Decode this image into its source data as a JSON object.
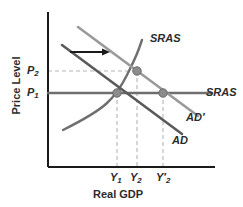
{
  "chart_data": {
    "type": "line",
    "title": "",
    "xlabel": "Real GDP",
    "ylabel": "Price Level",
    "grid": false,
    "legend": "none",
    "xlim": [
      0,
      1
    ],
    "ylim": [
      0,
      1
    ],
    "axis_ticks": {
      "x": [
        "Y1",
        "Y2",
        "Y2'"
      ],
      "y": [
        "P1",
        "P2"
      ]
    },
    "series": [
      {
        "name": "AD",
        "kind": "line",
        "color": "#5a5a5a",
        "points": [
          [
            62,
            45
          ],
          [
            182,
            134
          ]
        ],
        "label": "AD"
      },
      {
        "name": "AD'",
        "kind": "line",
        "color": "#9a9a9a",
        "points": [
          [
            78,
            27
          ],
          [
            198,
            116
          ]
        ],
        "label": "AD'"
      },
      {
        "name": "SRAS-upward",
        "kind": "curve",
        "color": "#6f6f6f",
        "points": [
          [
            63,
            130
          ],
          [
            95,
            114
          ],
          [
            118,
            93
          ],
          [
            136,
            57
          ],
          [
            142,
            40
          ]
        ],
        "label": "SRAS"
      },
      {
        "name": "SRAS-horizontal",
        "kind": "line",
        "color": "#6f6f6f",
        "points": [
          [
            48,
            93
          ],
          [
            212,
            93
          ]
        ],
        "label": "SRAS"
      }
    ],
    "markers": [
      {
        "name": "equilibrium-Y1-P1",
        "x": 117,
        "y": 93
      },
      {
        "name": "equilibrium-Y2-P2",
        "x": 137,
        "y": 71
      },
      {
        "name": "equilibrium-Y2prime-P1",
        "x": 163,
        "y": 93
      }
    ],
    "guides": [
      {
        "name": "p2-horizontal-dashed",
        "from": [
          48,
          71
        ],
        "to": [
          137,
          71
        ]
      },
      {
        "name": "y1-vertical-dashed",
        "from": [
          117,
          93
        ],
        "to": [
          117,
          167
        ]
      },
      {
        "name": "y2-vertical-dashed",
        "from": [
          137,
          71
        ],
        "to": [
          137,
          167
        ]
      },
      {
        "name": "y2prime-vertical-dashed",
        "from": [
          163,
          93
        ],
        "to": [
          163,
          167
        ]
      }
    ],
    "annotations": [
      {
        "name": "shift-arrow",
        "kind": "arrow",
        "from": [
          70,
          52
        ],
        "to": [
          110,
          52
        ],
        "color": "#1a1a1a",
        "text": ""
      }
    ]
  },
  "axes": {
    "y_title": "Price Level",
    "x_title": "Real GDP"
  },
  "ticks": {
    "price_high_base": "P",
    "price_high_sub": "2",
    "price_low_base": "P",
    "price_low_sub": "1",
    "y1_base": "Y",
    "y1_sub": "1",
    "y2_base": "Y",
    "y2_sub": "2",
    "y2p_base": "Y",
    "y2p_sub": "2",
    "y2p_prime": "′"
  },
  "curve_labels": {
    "sras_upward": "SRAS",
    "sras_horizontal": "SRAS",
    "ad_shifted": "AD",
    "ad_shifted_prime": "′",
    "ad_original": "AD"
  },
  "colors": {
    "axis": "#1a1a1a",
    "ad": "#5a5a5a",
    "ad_prime": "#9a9a9a",
    "sras": "#6f6f6f",
    "marker": "#8c8c8c",
    "marker_edge": "#6a6a6a",
    "guide": "#b5b5b5",
    "arrow": "#1a1a1a",
    "text": "#2b2b2b",
    "background": "#ffffff"
  }
}
